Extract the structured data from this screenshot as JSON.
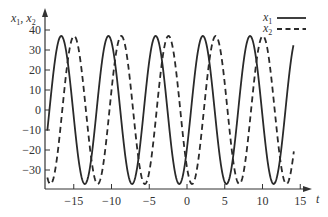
{
  "chart_data": {
    "type": "line",
    "title": "",
    "xlabel": "t",
    "ylabel": "x1, x2",
    "xlim": [
      -18.6,
      16.5
    ],
    "ylim": [
      -39,
      42
    ],
    "grid": false,
    "legend_position": "top-right",
    "x_ticks": [
      -15,
      -10,
      -5,
      0,
      5,
      10,
      15
    ],
    "x_tick_labels": [
      "−15",
      "−10",
      "−5",
      "0",
      "5",
      "10",
      "15"
    ],
    "y_ticks": [
      40,
      30,
      20,
      10,
      0,
      -10,
      -20,
      -30
    ],
    "y_tick_labels": [
      "40",
      "30",
      "20",
      "10",
      "0",
      "−10",
      "−20",
      "−30"
    ],
    "t_start": -18.5,
    "t_end": 14.1,
    "series": [
      {
        "name": "x1",
        "style": "solid",
        "function": "37*cos(1.005*(t-2.1))",
        "amplitude": 37,
        "omega": 1.005,
        "phase_t": 2.1,
        "peaks_t": [
          -16.7,
          -10.2,
          -4.0,
          2.1,
          8.3
        ],
        "troughs_t": [
          -13.2,
          -7.0,
          5.4,
          11.7
        ]
      },
      {
        "name": "x2",
        "style": "dashed",
        "function": "37*cos(1.005*(t-3.8))",
        "amplitude": 37,
        "omega": 1.005,
        "phase_t": 3.8,
        "peaks_t": [
          -15.1,
          -8.9,
          -2.3,
          3.7,
          10.1
        ],
        "troughs_t": [
          -17.9,
          -11.7,
          -5.3,
          1.1,
          7.3,
          13.6
        ]
      }
    ]
  },
  "legend": {
    "items": [
      {
        "label": "x",
        "sub": "1",
        "style": "solid"
      },
      {
        "label": "x",
        "sub": "2",
        "style": "dashed"
      }
    ]
  },
  "axes": {
    "y_label_main": "x",
    "y_label_sub1": "1",
    "y_label_sep": ", x",
    "y_label_sub2": "2",
    "x_label": "t"
  },
  "colors": {
    "line": "#2a2a2a",
    "axis": "#333333",
    "background": "#ffffff"
  }
}
